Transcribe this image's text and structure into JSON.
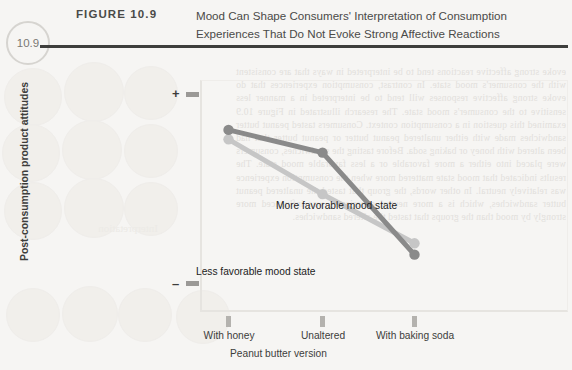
{
  "header": {
    "badge": "10.9",
    "figure_label": "FIGURE 10.9",
    "title_line1": "Mood Can Shape Consumers' Interpretation of Consumption",
    "title_line2": "Experiences That Do Not Evoke Strong Affective Reactions"
  },
  "colors": {
    "page_background": "#f6f5f3",
    "rule": "#3e3e3c",
    "badge_ring": "#d6d4d0",
    "axis": "#e6e4e0",
    "tick": "#b4b2ae",
    "text": "#3d3d3b",
    "series_more_favorable": "#8a8a8a",
    "series_less_favorable": "#c6c6c6",
    "ghost_text": "#e2e0dc"
  },
  "ghost_text": {
    "right_block": "evoke strong affective reactions tend to be interpreted in ways that are consistent with the consumer's mood state. In contrast, consumption experiences that do evoke strong affective responses will tend to be interpreted in a manner less sensitive to the consumer's mood state. The research illustrated in Figure 10.9 examined this question in a consumption context. Consumers tasted peanut butter sandwiches made with either unaltered peanut butter or peanut butter that had been altered with honey or baking soda. Before tasting the sandwiches, consumers were placed into either a more favorable or a less favorable mood state. The results indicated that mood state mattered more when the consumption experience was relatively neutral. In other words, the group that tasted the unaltered peanut butter sandwiches, which is a more neutral experience, was influenced more strongly by mood than the groups that tasted the altered sandwiches.",
    "left_word": "Interpretation"
  },
  "chart_data": {
    "type": "line",
    "title": "Mood Can Shape Consumers' Interpretation of Consumption Experiences That Do Not Evoke Strong Affective Reactions",
    "xlabel": "Peanut butter version",
    "ylabel": "Post-consumption product attitudes",
    "categories": [
      "With honey",
      "Unaltered",
      "With baking soda"
    ],
    "ytick_labels": [
      "+",
      "–"
    ],
    "ylim": [
      -1,
      1
    ],
    "grid": false,
    "legend_position": "inline-annotation",
    "series": [
      {
        "name": "More favorable mood state",
        "color": "#8a8a8a",
        "values": [
          0.62,
          0.38,
          -0.7
        ],
        "annotation": "More favorable mood state"
      },
      {
        "name": "Less favorable mood state",
        "color": "#c6c6c6",
        "values": [
          0.52,
          -0.06,
          -0.58
        ],
        "annotation": "Less favorable mood state"
      }
    ]
  }
}
